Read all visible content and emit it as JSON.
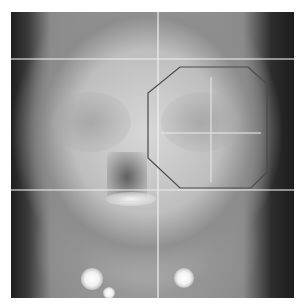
{
  "image": {
    "type": "radiograph",
    "view": "frontal skull x-ray",
    "width": 283,
    "height": 286,
    "offset": [
      11,
      12
    ]
  },
  "overlay": {
    "shape": "octagon",
    "stroke_color": "#4a4a4a",
    "points": [
      [
        169,
        55
      ],
      [
        237,
        55
      ],
      [
        256,
        72
      ],
      [
        256,
        160
      ],
      [
        240,
        176
      ],
      [
        169,
        176
      ],
      [
        137,
        146
      ],
      [
        137,
        81
      ]
    ]
  },
  "reference_lines": {
    "horizontal_y": [
      46,
      177
    ],
    "vertical_x": [
      146
    ]
  },
  "colors": {
    "background": "#ffffff",
    "film_dark": "#1c1c1c",
    "bone_light": "#d7d7d7"
  }
}
